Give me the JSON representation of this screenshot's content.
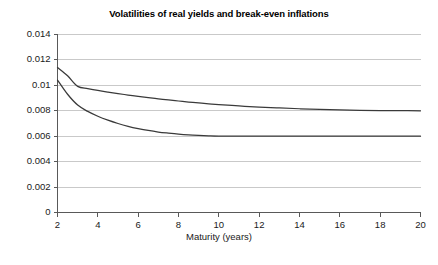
{
  "chart_data": {
    "type": "line",
    "title": "Volatilities of real yields and break-even inflations",
    "xlabel": "Maturity (years)",
    "ylabel": "",
    "xlim": [
      2,
      20
    ],
    "ylim": [
      0,
      0.014
    ],
    "grid": true,
    "legend": "none",
    "xticks": [
      "2",
      "4",
      "6",
      "8",
      "10",
      "12",
      "14",
      "16",
      "18",
      "20"
    ],
    "xtick_values": [
      2,
      4,
      6,
      8,
      10,
      12,
      14,
      16,
      18,
      20
    ],
    "yticks": [
      "0",
      "0.002",
      "0.004",
      "0.006",
      "0.008",
      "0.01",
      "0.012",
      "0.014"
    ],
    "ytick_values": [
      0,
      0.002,
      0.004,
      0.006,
      0.008,
      0.01,
      0.012,
      0.014
    ],
    "line_color": "#3a3a3a",
    "grid_color": "#c9c9c9",
    "axis_color": "#595959",
    "x": [
      2,
      2.5,
      3,
      3.5,
      4,
      4.5,
      5,
      5.5,
      6,
      6.5,
      7,
      7.5,
      8,
      8.5,
      9,
      9.5,
      10,
      11,
      12,
      13,
      14,
      15,
      16,
      17,
      18,
      19,
      20
    ],
    "series": [
      {
        "name": "real yield volatility",
        "values": [
          0.0114,
          0.01075,
          0.00992,
          0.00975,
          0.0096,
          0.00947,
          0.00935,
          0.00924,
          0.00913,
          0.00903,
          0.00894,
          0.00885,
          0.00877,
          0.00869,
          0.00862,
          0.00855,
          0.00849,
          0.00838,
          0.00829,
          0.00822,
          0.00816,
          0.00811,
          0.00807,
          0.00804,
          0.00802,
          0.00801,
          0.008
        ]
      },
      {
        "name": "break-even inflation volatility",
        "values": [
          0.01042,
          0.0093,
          0.00845,
          0.00795,
          0.00757,
          0.00726,
          0.007,
          0.00678,
          0.0066,
          0.00645,
          0.00633,
          0.00624,
          0.00616,
          0.0061,
          0.00606,
          0.00603,
          0.00601,
          0.006,
          0.006,
          0.006,
          0.006,
          0.006,
          0.006,
          0.006,
          0.006,
          0.006,
          0.006
        ]
      }
    ]
  }
}
